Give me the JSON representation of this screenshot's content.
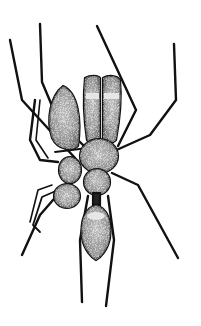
{
  "image": {
    "subject": "ant-mimicking spider illustration",
    "style": "black ink stipple drawing on white",
    "colors": {
      "background": "#ffffff",
      "ink": "#111111",
      "stipple_fill": "#8a8a8a",
      "highlight_band": "#e6e6e6"
    }
  }
}
